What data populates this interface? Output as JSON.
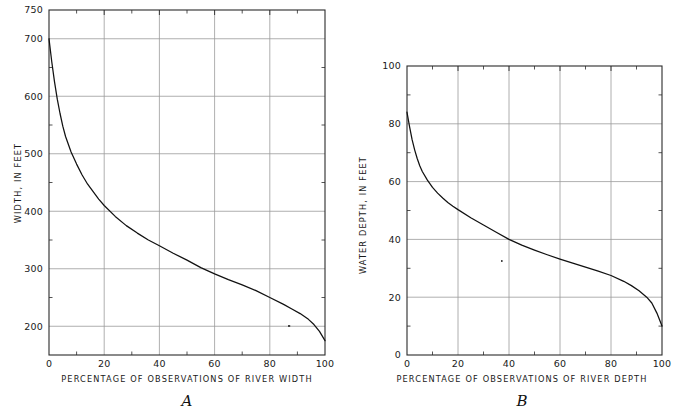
{
  "figure": {
    "background": "#ffffff",
    "grid_color": "#9a9a9a",
    "axis_color": "#2a2a2a",
    "curve_color": "#111111"
  },
  "panels": [
    {
      "id": "A",
      "letter": "A",
      "xlabel": "PERCENTAGE OF OBSERVATIONS OF RIVER WIDTH",
      "ylabel": "WIDTH, IN FEET",
      "x_major_labels": [
        "0",
        "20",
        "40",
        "60",
        "80",
        "100"
      ],
      "y_major_labels": [
        "200",
        "300",
        "400",
        "500",
        "600",
        "700",
        "750"
      ]
    },
    {
      "id": "B",
      "letter": "B",
      "xlabel": "PERCENTAGE OF OBSERVATIONS OF RIVER DEPTH",
      "ylabel": "WATER DEPTH, IN FEET",
      "x_major_labels": [
        "0",
        "20",
        "40",
        "60",
        "80",
        "100"
      ],
      "y_major_labels": [
        "0",
        "20",
        "40",
        "60",
        "80",
        "100"
      ]
    }
  ],
  "chart_data": [
    {
      "type": "line",
      "id": "A",
      "title": "A",
      "xlabel": "PERCENTAGE OF OBSERVATIONS OF RIVER WIDTH",
      "ylabel": "WIDTH, IN FEET",
      "xlim": [
        0,
        100
      ],
      "ylim": [
        150,
        750
      ],
      "x_ticks_major": [
        0,
        20,
        40,
        60,
        80,
        100
      ],
      "x_ticks_minor": [
        10,
        30,
        50,
        70,
        90
      ],
      "y_ticks_major": [
        200,
        300,
        400,
        500,
        600,
        700,
        750
      ],
      "y_ticks_minor": [
        250,
        350,
        450,
        550,
        650
      ],
      "grid": true,
      "legend": "none",
      "series": [
        {
          "name": "River width duration curve",
          "x": [
            0,
            1,
            2,
            3,
            4,
            5,
            6,
            8,
            10,
            12,
            14,
            16,
            18,
            20,
            24,
            28,
            32,
            36,
            40,
            45,
            50,
            55,
            60,
            65,
            70,
            75,
            80,
            85,
            88,
            91,
            94,
            96,
            98,
            100
          ],
          "y": [
            700,
            660,
            625,
            595,
            570,
            548,
            530,
            503,
            482,
            463,
            447,
            434,
            421,
            410,
            391,
            375,
            362,
            350,
            340,
            327,
            315,
            302,
            291,
            281,
            272,
            262,
            250,
            238,
            230,
            222,
            212,
            203,
            191,
            175
          ]
        }
      ]
    },
    {
      "type": "line",
      "id": "B",
      "title": "B",
      "xlabel": "PERCENTAGE OF OBSERVATIONS OF RIVER DEPTH",
      "ylabel": "WATER DEPTH, IN FEET",
      "xlim": [
        0,
        100
      ],
      "ylim": [
        0,
        100
      ],
      "x_ticks_major": [
        0,
        20,
        40,
        60,
        80,
        100
      ],
      "x_ticks_minor": [
        10,
        30,
        50,
        70,
        90
      ],
      "y_ticks_major": [
        0,
        20,
        40,
        60,
        80,
        100
      ],
      "y_ticks_minor": [
        10,
        30,
        50,
        70,
        90
      ],
      "grid": true,
      "legend": "none",
      "series": [
        {
          "name": "River depth duration curve",
          "x": [
            0,
            1,
            2,
            3,
            4,
            5,
            6,
            8,
            10,
            12,
            14,
            16,
            18,
            20,
            25,
            30,
            35,
            40,
            45,
            50,
            55,
            60,
            65,
            70,
            75,
            80,
            85,
            88,
            91,
            94,
            96,
            98,
            100
          ],
          "y": [
            84,
            79,
            74.5,
            71,
            68,
            65.5,
            63.5,
            60.5,
            58,
            56,
            54.3,
            52.8,
            51.5,
            50.3,
            47.5,
            45,
            42.5,
            40,
            38,
            36.3,
            34.7,
            33.2,
            31.8,
            30.4,
            29,
            27.5,
            25.5,
            24,
            22.2,
            20,
            18,
            14.5,
            10
          ]
        }
      ]
    }
  ]
}
